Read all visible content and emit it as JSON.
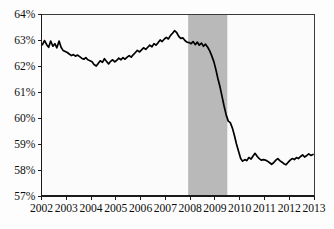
{
  "chart_data": {
    "type": "line",
    "title": "",
    "subtitle": "",
    "xlabel": "",
    "ylabel": "",
    "xlim": [
      2002.0,
      2013.0
    ],
    "ylim": [
      57,
      64
    ],
    "grid": false,
    "legend": null,
    "y_tick_labels": [
      "64%",
      "63%",
      "62%",
      "61%",
      "60%",
      "59%",
      "58%",
      "57%"
    ],
    "y_tick_values": [
      64,
      63,
      62,
      61,
      60,
      59,
      58,
      57
    ],
    "x_tick_labels": [
      "2002",
      "2003",
      "2004",
      "2005",
      "2006",
      "2007",
      "2008",
      "2009",
      "2010",
      "2011",
      "2012",
      "2013"
    ],
    "x_tick_values": [
      2002,
      2003,
      2004,
      2005,
      2006,
      2007,
      2008,
      2009,
      2010,
      2011,
      2012,
      2013
    ],
    "annotations": [
      {
        "name": "recession-band",
        "type": "vertical-span",
        "x_start": 2007.92,
        "x_end": 2009.5,
        "color": "#b9b9b9",
        "label": ""
      }
    ],
    "series": [
      {
        "name": "Labor Force Participation Rate",
        "color": "#000000",
        "x": [
          2002.04,
          2002.12,
          2002.21,
          2002.29,
          2002.37,
          2002.46,
          2002.54,
          2002.62,
          2002.71,
          2002.79,
          2002.87,
          2002.96,
          2003.04,
          2003.12,
          2003.21,
          2003.29,
          2003.37,
          2003.46,
          2003.54,
          2003.62,
          2003.71,
          2003.79,
          2003.87,
          2003.96,
          2004.04,
          2004.12,
          2004.21,
          2004.29,
          2004.37,
          2004.46,
          2004.54,
          2004.62,
          2004.71,
          2004.79,
          2004.87,
          2004.96,
          2005.04,
          2005.12,
          2005.21,
          2005.29,
          2005.37,
          2005.46,
          2005.54,
          2005.62,
          2005.71,
          2005.79,
          2005.87,
          2005.96,
          2006.04,
          2006.12,
          2006.21,
          2006.29,
          2006.37,
          2006.46,
          2006.54,
          2006.62,
          2006.71,
          2006.79,
          2006.87,
          2006.96,
          2007.04,
          2007.12,
          2007.21,
          2007.29,
          2007.37,
          2007.46,
          2007.54,
          2007.62,
          2007.71,
          2007.79,
          2007.87,
          2007.96,
          2008.04,
          2008.12,
          2008.21,
          2008.29,
          2008.37,
          2008.46,
          2008.54,
          2008.62,
          2008.71,
          2008.79,
          2008.87,
          2008.96,
          2009.04,
          2009.12,
          2009.21,
          2009.29,
          2009.37,
          2009.46,
          2009.54,
          2009.62,
          2009.71,
          2009.79,
          2009.87,
          2009.96,
          2010.04,
          2010.12,
          2010.21,
          2010.29,
          2010.37,
          2010.46,
          2010.54,
          2010.62,
          2010.71,
          2010.79,
          2010.87,
          2010.96,
          2011.04,
          2011.12,
          2011.21,
          2011.29,
          2011.37,
          2011.46,
          2011.54,
          2011.62,
          2011.71,
          2011.79,
          2011.87,
          2011.96,
          2012.04,
          2012.12,
          2012.21,
          2012.29,
          2012.37,
          2012.46,
          2012.54,
          2012.62,
          2012.71,
          2012.79,
          2012.87,
          2012.96
        ],
        "y": [
          62.82,
          62.98,
          62.82,
          62.72,
          62.96,
          62.76,
          62.86,
          62.7,
          62.96,
          62.72,
          62.6,
          62.56,
          62.52,
          62.46,
          62.4,
          62.44,
          62.38,
          62.42,
          62.36,
          62.3,
          62.26,
          62.32,
          62.24,
          62.2,
          62.16,
          62.06,
          62.0,
          62.1,
          62.2,
          62.14,
          62.28,
          62.18,
          62.08,
          62.18,
          62.24,
          62.16,
          62.22,
          62.3,
          62.24,
          62.32,
          62.26,
          62.34,
          62.4,
          62.34,
          62.44,
          62.52,
          62.6,
          62.54,
          62.62,
          62.7,
          62.64,
          62.72,
          62.8,
          62.74,
          62.86,
          62.8,
          62.9,
          63.0,
          62.94,
          63.04,
          63.1,
          63.04,
          63.18,
          63.26,
          63.36,
          63.28,
          63.14,
          63.06,
          63.08,
          62.98,
          62.92,
          62.9,
          62.86,
          62.94,
          62.82,
          62.92,
          62.8,
          62.88,
          62.76,
          62.84,
          62.72,
          62.58,
          62.4,
          62.16,
          61.86,
          61.52,
          61.18,
          60.82,
          60.46,
          60.1,
          59.88,
          59.82,
          59.6,
          59.32,
          59.0,
          58.7,
          58.44,
          58.34,
          58.4,
          58.36,
          58.48,
          58.42,
          58.54,
          58.64,
          58.52,
          58.44,
          58.38,
          58.4,
          58.38,
          58.34,
          58.28,
          58.22,
          58.28,
          58.38,
          58.44,
          58.36,
          58.3,
          58.24,
          58.2,
          58.3,
          58.38,
          58.44,
          58.4,
          58.48,
          58.44,
          58.52,
          58.58,
          58.5,
          58.56,
          58.62,
          58.56,
          58.6
        ]
      }
    ]
  },
  "figure": {
    "background_color": "#fdfdfd",
    "plot_background_color": "#fbfbfb",
    "axis_color": "#1a1a1a",
    "line_color": "#000000",
    "band_color": "#b9b9b9"
  }
}
